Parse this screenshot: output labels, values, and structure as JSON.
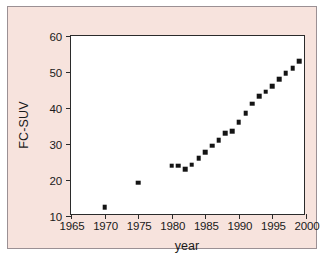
{
  "chart_data": {
    "type": "scatter",
    "title": "",
    "xlabel": "year",
    "ylabel": "FC-SUV",
    "xlim": [
      1965,
      2000
    ],
    "ylim": [
      10,
      60
    ],
    "xticks": [
      1965,
      1970,
      1975,
      1980,
      1985,
      1990,
      1995,
      2000
    ],
    "yticks": [
      10,
      20,
      30,
      40,
      50,
      60
    ],
    "grid": false,
    "legend": null,
    "marker": "square",
    "marker_color": "#141414",
    "series": [
      {
        "name": "FC-SUV",
        "x": [
          1970,
          1975,
          1980,
          1981,
          1982,
          1983,
          1984,
          1985,
          1986,
          1987,
          1988,
          1989,
          1990,
          1991,
          1992,
          1993,
          1994,
          1995,
          1996,
          1997,
          1998,
          1999
        ],
        "values": [
          12.5,
          19.2,
          24.0,
          24.0,
          23.0,
          24.3,
          26.0,
          27.7,
          29.5,
          31.0,
          33.0,
          33.5,
          36.0,
          38.5,
          41.2,
          43.2,
          44.5,
          46.0,
          48.0,
          49.7,
          51.0,
          53.0
        ]
      }
    ]
  },
  "colors": {
    "panel_background": "#f7e3dd",
    "plot_background": "#ffffff",
    "axis": "#2b2b2b",
    "marker": "#141414",
    "panel_border": "#9b9094"
  }
}
